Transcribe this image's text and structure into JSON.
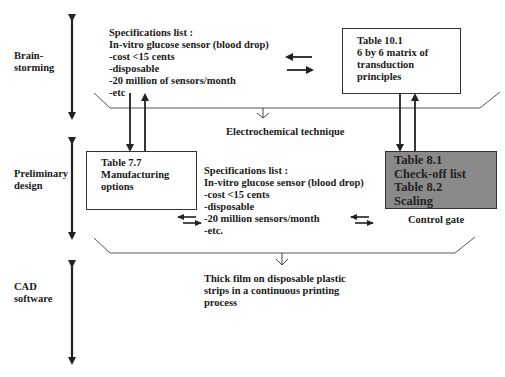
{
  "stages": [
    {
      "label_lines": [
        "Brain-",
        "storming"
      ]
    },
    {
      "label_lines": [
        "Preliminary",
        "design"
      ]
    },
    {
      "label_lines": [
        "CAD",
        "software"
      ]
    }
  ],
  "spec_list_top": {
    "title": "Specifications list :",
    "items": [
      "In-vitro glucose sensor (blood drop)",
      "-cost <15 cents",
      "-disposable",
      "-20 million of sensors/month",
      "-etc"
    ]
  },
  "table_10_1": {
    "lines": [
      "Table 10.1",
      "6 by 6 matrix of",
      "transduction",
      "principles"
    ]
  },
  "funnel_1_output": "Electrochemical technique",
  "table_7_7": {
    "lines": [
      "Table 7.7",
      "Manufacturing",
      "options"
    ]
  },
  "spec_list_mid": {
    "title": "Specifications list :",
    "items": [
      "In-vitro glucose sensor (blood drop)",
      "-cost <15 cents",
      "-disposable",
      "-20 million sensors/month",
      "-etc."
    ]
  },
  "control_gate_box": {
    "lines": [
      "Table 8.1",
      "Check-off list",
      "Table 8.2",
      "Scaling"
    ],
    "fill": "#8a8a8a"
  },
  "control_gate_label": "Control gate",
  "funnel_2_output": {
    "lines": [
      "Thick film on disposable plastic",
      "strips in a continuous printing",
      "process"
    ]
  }
}
